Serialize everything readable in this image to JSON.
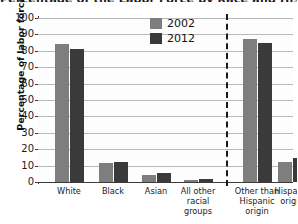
{
  "chart_data": {
    "type": "bar",
    "title": "Percentage of the Labor Force by Race and Hispanic Origin",
    "xlabel": "",
    "ylabel": "Percentage of labor force",
    "ylim": [
      0,
      100
    ],
    "ytick_labels": [
      "100",
      "90",
      "80",
      "70",
      "60",
      "50",
      "40",
      "30",
      "20",
      "10",
      "0"
    ],
    "ytick_values": [
      100,
      90,
      80,
      70,
      60,
      50,
      40,
      30,
      20,
      10,
      0
    ],
    "grid": true,
    "legend_position": "top-center",
    "categories": [
      "White",
      "Black",
      "Asian",
      "All other racial groups",
      "Other than Hispanic origin",
      "Hispanic origin"
    ],
    "category_lines": [
      [
        "White"
      ],
      [
        "Black"
      ],
      [
        "Asian"
      ],
      [
        "All other",
        "racial",
        "groups"
      ],
      [
        "Other than",
        "Hispanic",
        "origin"
      ],
      [
        "Hispanic",
        "origin"
      ]
    ],
    "series": [
      {
        "name": "2002",
        "color": "#7e7e7e",
        "values": [
          84,
          11.5,
          4.5,
          1.5,
          87.5,
          12.5
        ]
      },
      {
        "name": "2012",
        "color": "#3a3a3a",
        "values": [
          81,
          12.5,
          5.5,
          2,
          85,
          14.5
        ]
      }
    ],
    "annotations": [
      {
        "type": "vertical-dashed-divider",
        "after_category": "All other racial groups"
      }
    ]
  },
  "colors": {
    "series_2002": "#7e7e7e",
    "series_2012": "#3a3a3a",
    "axis": "#3b3b3b",
    "gridline": "#b9b9b9",
    "text": "#1a1a1a",
    "background": "#ffffff"
  }
}
